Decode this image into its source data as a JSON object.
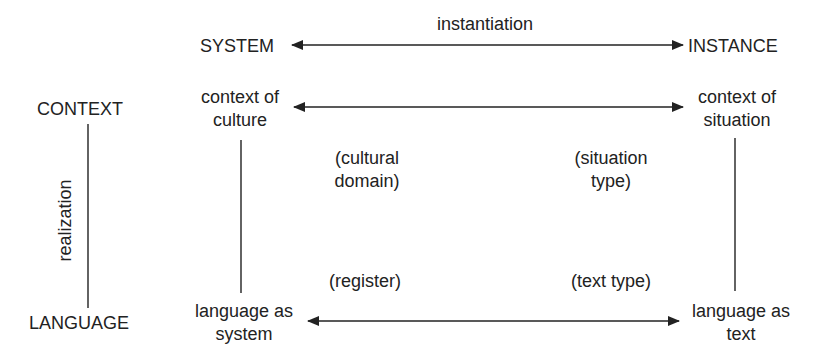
{
  "diagram": {
    "top_axis": {
      "label": "instantiation",
      "left_pole": "SYSTEM",
      "right_pole": "INSTANCE"
    },
    "side_axis": {
      "label": "realization",
      "top_pole": "CONTEXT",
      "bottom_pole": "LANGUAGE"
    },
    "nodes": {
      "context_of_culture": {
        "line1": "context of",
        "line2": "culture"
      },
      "context_of_situation": {
        "line1": "context of",
        "line2": "situation"
      },
      "language_as_system": {
        "line1": "language as",
        "line2": "system"
      },
      "language_as_text": {
        "line1": "language as",
        "line2": "text"
      }
    },
    "intermediate": {
      "cultural_domain": {
        "line1": "(cultural",
        "line2": "domain)"
      },
      "situation_type": {
        "line1": "(situation",
        "line2": "type)"
      },
      "register": "(register)",
      "text_type": "(text type)"
    },
    "colors": {
      "ink": "#222222",
      "background": "#ffffff"
    }
  }
}
